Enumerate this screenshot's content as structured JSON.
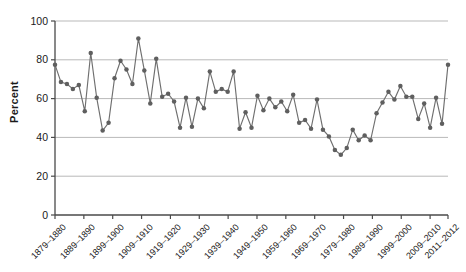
{
  "chart_data": {
    "type": "line",
    "title": "",
    "xlabel": "",
    "ylabel": "Percent",
    "ylim": [
      0,
      100
    ],
    "yticks": [
      0,
      20,
      40,
      60,
      80,
      100
    ],
    "grid": true,
    "legend": "none",
    "marker": "circle",
    "line_color": "#6f6f6f",
    "marker_color": "#5f5f5f",
    "grid_color": "#b9b9b9",
    "axis_color": "#4a4a4a",
    "xtick_labels": [
      "1879–1880",
      "1889–1890",
      "1899–1900",
      "1909–1910",
      "1919–1920",
      "1929–1930",
      "1939–1940",
      "1949–1950",
      "1959–1960",
      "1969–1970",
      "1979–1980",
      "1989–1990",
      "1999–2000",
      "2009–2010",
      "2011–2012"
    ],
    "x": [
      1880,
      1882,
      1884,
      1886,
      1888,
      1890,
      1892,
      1894,
      1896,
      1898,
      1900,
      1902,
      1904,
      1906,
      1908,
      1910,
      1912,
      1914,
      1916,
      1918,
      1920,
      1922,
      1924,
      1926,
      1928,
      1930,
      1932,
      1934,
      1936,
      1938,
      1940,
      1942,
      1944,
      1946,
      1948,
      1950,
      1952,
      1954,
      1956,
      1958,
      1960,
      1962,
      1964,
      1966,
      1968,
      1970,
      1972,
      1974,
      1976,
      1978,
      1980,
      1982,
      1984,
      1986,
      1988,
      1990,
      1992,
      1994,
      1996,
      1998,
      2000,
      2002,
      2004,
      2006,
      2008,
      2010,
      2012
    ],
    "values": [
      77.5,
      68.5,
      67.5,
      65.0,
      67.0,
      53.5,
      83.5,
      60.5,
      43.5,
      47.5,
      70.5,
      79.5,
      75.0,
      67.5,
      91.0,
      74.5,
      57.5,
      80.5,
      61.0,
      62.5,
      58.5,
      45.0,
      60.5,
      45.5,
      60.0,
      55.0,
      74.0,
      63.5,
      65.0,
      63.5,
      74.0,
      44.5,
      53.0,
      45.0,
      61.5,
      54.0,
      60.0,
      55.5,
      58.5,
      53.5,
      62.0,
      47.5,
      49.0,
      44.5,
      59.5,
      44.0,
      40.5,
      33.5,
      31.0,
      34.5,
      44.0,
      38.5,
      41.0,
      38.5,
      52.5,
      58.0,
      63.5,
      59.5,
      66.5,
      61.0,
      61.0,
      49.5,
      57.5,
      45.0,
      60.5,
      47.0,
      77.5
    ]
  }
}
